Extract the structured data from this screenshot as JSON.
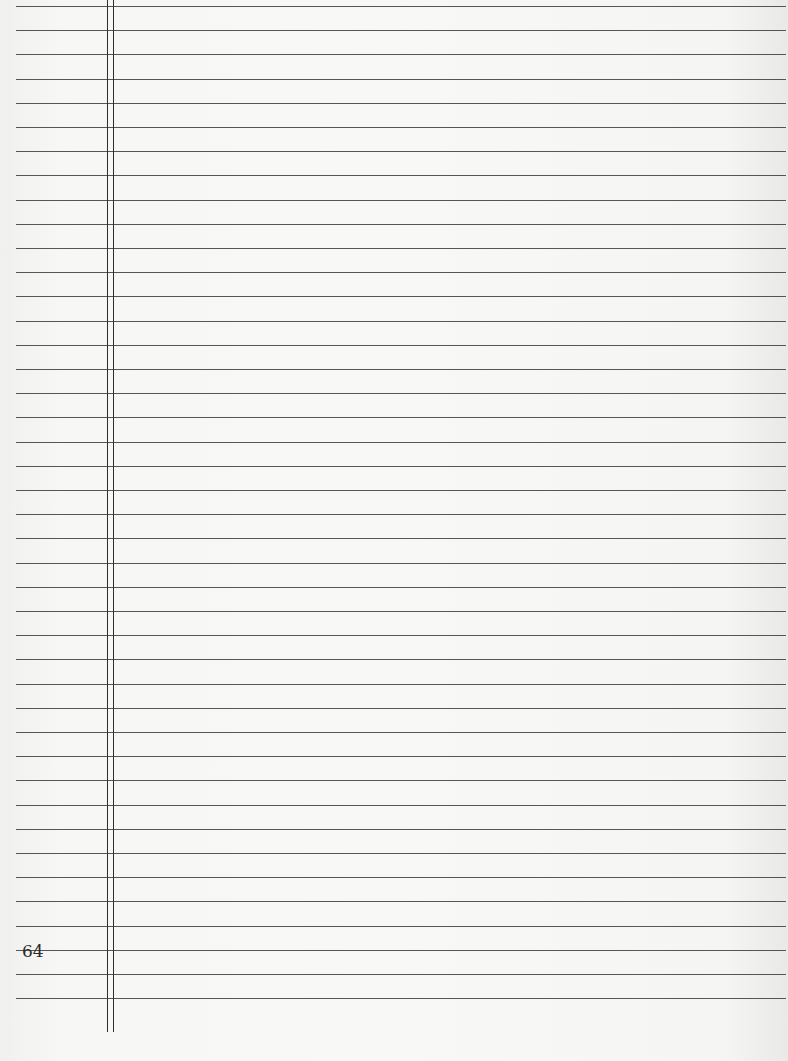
{
  "document": {
    "type": "ruled-notebook-page",
    "page_number": "64",
    "ruled_lines": {
      "count": 42,
      "first_y": 6,
      "spacing_px": 24.2
    },
    "margin": {
      "double_line": true,
      "x_positions": [
        107,
        113
      ]
    },
    "colors": {
      "paper": "#f7f7f5",
      "lines": "#3a3a3a"
    }
  }
}
